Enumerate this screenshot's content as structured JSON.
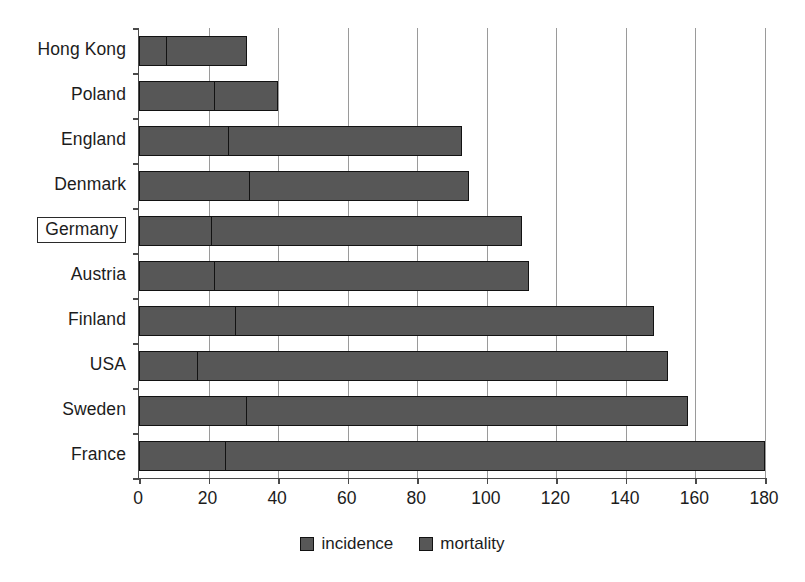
{
  "chart_data": {
    "type": "bar",
    "orientation": "horizontal",
    "stacked": true,
    "title": "",
    "xlabel": "",
    "ylabel": "",
    "xlim": [
      0,
      180
    ],
    "xticks": [
      0,
      20,
      40,
      60,
      80,
      100,
      120,
      140,
      160,
      180
    ],
    "grid": "vertical",
    "legend_position": "bottom-center",
    "categories": [
      "Hong Kong",
      "Poland",
      "England",
      "Denmark",
      "Germany",
      "Austria",
      "Finland",
      "USA",
      "Sweden",
      "France"
    ],
    "highlighted_category": "Germany",
    "series": [
      {
        "name": "mortality",
        "color": "#575757",
        "values": [
          8,
          22,
          26,
          32,
          21,
          22,
          28,
          17,
          31,
          25
        ]
      },
      {
        "name": "incidence",
        "color": "#575757",
        "values": [
          31,
          40,
          93,
          95,
          110,
          112,
          148,
          152,
          158,
          180
        ],
        "note": "incidence is the bar total (outer segment end)"
      }
    ],
    "bar_totals": [
      31,
      40,
      93,
      95,
      110,
      112,
      148,
      152,
      158,
      180
    ]
  },
  "legend": {
    "items": [
      {
        "label": "incidence",
        "swatch": "legend-swatch-incidence"
      },
      {
        "label": "mortality",
        "swatch": "legend-swatch-mortality"
      }
    ]
  },
  "axis": {
    "x_tick_labels": [
      "0",
      "20",
      "40",
      "60",
      "80",
      "100",
      "120",
      "140",
      "160",
      "180"
    ],
    "y_tick_labels": [
      "Hong Kong",
      "Poland",
      "England",
      "Denmark",
      "Germany",
      "Austria",
      "Finland",
      "USA",
      "Sweden",
      "France"
    ]
  },
  "colors": {
    "bar_fill": "#575757",
    "bar_stroke": "#121212",
    "gridline": "#9a9a9a",
    "axis": "#4a4a4a",
    "text": "#1c1c1c",
    "background": "#ffffff"
  }
}
